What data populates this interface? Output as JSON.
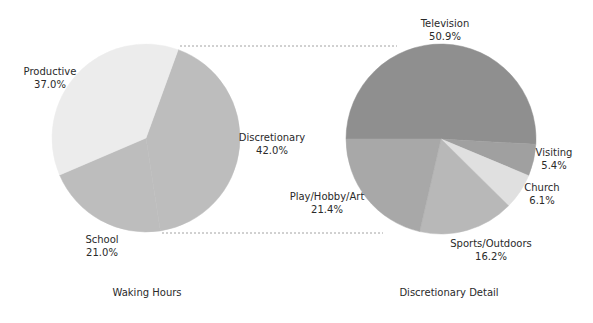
{
  "chart_data": [
    {
      "type": "pie",
      "title": "Waking Hours",
      "start_angle_deg": 20,
      "center": [
        146,
        138
      ],
      "radius": 94,
      "slices": [
        {
          "label": "Discretionary",
          "value": 42.0,
          "value_label": "42.0%",
          "color": "#bdbdbd",
          "label_pos": [
            272,
            138
          ]
        },
        {
          "label": "School",
          "value": 21.0,
          "value_label": "21.0%",
          "color": "#bdbdbd",
          "label_pos": [
            102,
            240
          ]
        },
        {
          "label": "Productive",
          "value": 37.0,
          "value_label": "37.0%",
          "color": "#ececec",
          "label_pos": [
            50,
            72
          ]
        }
      ]
    },
    {
      "type": "pie",
      "title": "Discretionary Detail",
      "start_angle_deg": 270,
      "center": [
        441,
        139
      ],
      "radius": 95,
      "slices": [
        {
          "label": "Television",
          "value": 50.9,
          "value_label": "50.9%",
          "color": "#8f8f8f",
          "label_pos": [
            445,
            24
          ]
        },
        {
          "label": "Visiting",
          "value": 5.4,
          "value_label": "5.4%",
          "color": "#a0a0a0",
          "label_pos": [
            554,
            153
          ]
        },
        {
          "label": "Church",
          "value": 6.1,
          "value_label": "6.1%",
          "color": "#e0e0e0",
          "label_pos": [
            542,
            188
          ]
        },
        {
          "label": "Sports/Outdoors",
          "value": 16.2,
          "value_label": "16.2%",
          "color": "#b8b8b8",
          "label_pos": [
            491,
            244
          ]
        },
        {
          "label": "Play/Hobby/Art",
          "value": 21.4,
          "value_label": "21.4%",
          "color": "#a8a8a8",
          "label_pos": [
            327,
            197
          ]
        }
      ]
    }
  ],
  "titles": {
    "left": "Waking Hours",
    "right": "Discretionary Detail"
  },
  "connectors": {
    "top": [
      180,
      46,
      397,
      46
    ],
    "bottom": [
      162,
      233,
      383,
      233
    ]
  }
}
